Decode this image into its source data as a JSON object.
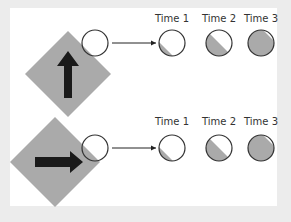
{
  "colors": {
    "background": "#ececec",
    "panel": "#ffffff",
    "diamond": "#aaaaaa",
    "arrow": "#1a1a1a",
    "circle_stroke": "#333333",
    "fill": "#aaaaaa"
  },
  "rows": [
    {
      "name": "vertical-arrow-row",
      "arrow_direction": "up",
      "times": [
        {
          "label": "Time 1",
          "fill_fraction": 0.2
        },
        {
          "label": "Time 2",
          "fill_fraction": 0.5
        },
        {
          "label": "Time 3",
          "fill_fraction": 0.9
        }
      ]
    },
    {
      "name": "horizontal-arrow-row",
      "arrow_direction": "right",
      "times": [
        {
          "label": "Time 1",
          "fill_fraction": 0.2
        },
        {
          "label": "Time 2",
          "fill_fraction": 0.5
        },
        {
          "label": "Time 3",
          "fill_fraction": 0.9
        }
      ]
    }
  ]
}
